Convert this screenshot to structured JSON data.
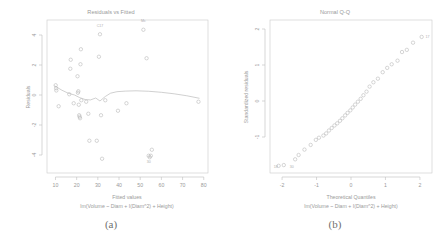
{
  "figure": {
    "background": "#ffffff",
    "point_color": "#b4b4b4",
    "axis_color": "#bdbdbd",
    "text_color": "#9a9a9a"
  },
  "panels": [
    {
      "key": "a",
      "caption": "(a)",
      "title": "Residuals vs Fitted",
      "xlabel": "Fitted values",
      "sublabel": "lm(Volume ~ Diam + I(Diam^2) + Height)",
      "ylabel": "Residuals",
      "xticks": [
        "10",
        "20",
        "30",
        "40",
        "50",
        "60",
        "70",
        "80"
      ],
      "yticks": [
        "4",
        "2",
        "0",
        "-2",
        "-4"
      ]
    },
    {
      "key": "b",
      "caption": "(b)",
      "title": "Normal Q-Q",
      "xlabel": "Theoretical Quantiles",
      "sublabel": "lm(Volume ~ Diam + I(Diam^2) + Height)",
      "ylabel": "Standardized residuals",
      "xticks": [
        "-2",
        "-1",
        "0",
        "1",
        "2"
      ],
      "yticks": [
        "2",
        "1",
        "0",
        "-1"
      ]
    }
  ],
  "chart_data": [
    {
      "type": "scatter",
      "panel": "a",
      "title": "Residuals vs Fitted",
      "xlabel": "Fitted values",
      "ylabel": "Residuals",
      "xlim": [
        6,
        82
      ],
      "ylim": [
        -5.2,
        5.0
      ],
      "grid": false,
      "legend": "none",
      "x": [
        10.1,
        10.3,
        10.4,
        11.5,
        16.5,
        17.0,
        17.2,
        18.6,
        20.4,
        20.6,
        20.8,
        21.0,
        21.2,
        21.4,
        21.6,
        21.8,
        22.0,
        22.2,
        24.5,
        25.5,
        26.0,
        29.5,
        30.5,
        31.0,
        31.5,
        32.0,
        33.5,
        39.5,
        43.5,
        51.5,
        53.0,
        54.0,
        54.5,
        55.0,
        55.5,
        77.5
      ],
      "y": [
        0.65,
        0.45,
        0.3,
        -0.75,
        0.05,
        1.75,
        2.35,
        -0.55,
        1.25,
        0.15,
        0.25,
        -0.65,
        -1.35,
        -1.45,
        -1.55,
        2.05,
        3.05,
        -0.35,
        -0.45,
        -1.25,
        -3.05,
        -3.05,
        2.55,
        4.05,
        -1.35,
        -4.25,
        -0.35,
        -1.05,
        -0.55,
        4.35,
        2.45,
        -4.05,
        -4.15,
        -4.05,
        -3.65,
        -0.45
      ],
      "point_labels": [
        {
          "text": "C17",
          "x": 31.0,
          "y": 4.55
        },
        {
          "text": "Mc",
          "x": 51.5,
          "y": 4.85
        },
        {
          "text": "30",
          "x": 54.0,
          "y": -4.55
        }
      ],
      "lowess": {
        "x": [
          9.5,
          13,
          16,
          19,
          21.5,
          24,
          26.5,
          29,
          31,
          33.5,
          36,
          39,
          43,
          48,
          54,
          60,
          66,
          72,
          78
        ],
        "y": [
          0.62,
          0.32,
          0.12,
          0.0,
          -0.18,
          -0.3,
          -0.33,
          -0.2,
          -0.4,
          -0.1,
          0.12,
          0.22,
          0.26,
          0.28,
          0.25,
          0.18,
          0.08,
          -0.05,
          -0.22
        ]
      }
    },
    {
      "type": "scatter",
      "panel": "b",
      "title": "Normal Q-Q",
      "xlabel": "Theoretical Quantiles",
      "ylabel": "Standardized residuals",
      "xlim": [
        -2.35,
        2.35
      ],
      "ylim": [
        -2.0,
        2.25
      ],
      "grid": false,
      "legend": "none",
      "x": [
        -2.1,
        -1.95,
        -1.62,
        -1.52,
        -1.35,
        -1.17,
        -1.02,
        -0.93,
        -0.8,
        -0.72,
        -0.64,
        -0.56,
        -0.48,
        -0.4,
        -0.32,
        -0.25,
        -0.17,
        -0.1,
        -0.02,
        0.05,
        0.12,
        0.2,
        0.28,
        0.36,
        0.45,
        0.54,
        0.65,
        0.78,
        0.92,
        1.05,
        1.18,
        1.35,
        1.48,
        1.62,
        1.8,
        2.05
      ],
      "y": [
        -1.8,
        -1.78,
        -1.62,
        -1.5,
        -1.35,
        -1.22,
        -1.08,
        -1.02,
        -0.96,
        -0.9,
        -0.82,
        -0.75,
        -0.68,
        -0.62,
        -0.55,
        -0.48,
        -0.4,
        -0.33,
        -0.26,
        -0.18,
        -0.1,
        -0.02,
        0.06,
        0.16,
        0.26,
        0.4,
        0.52,
        0.62,
        0.8,
        0.92,
        1.02,
        1.12,
        1.36,
        1.42,
        1.62,
        1.78
      ],
      "point_labels": [
        {
          "text": "18",
          "x": -2.18,
          "y": -1.86
        },
        {
          "text": "30",
          "x": -1.72,
          "y": -1.86
        },
        {
          "text": "17",
          "x": 2.22,
          "y": 1.74
        }
      ]
    }
  ]
}
